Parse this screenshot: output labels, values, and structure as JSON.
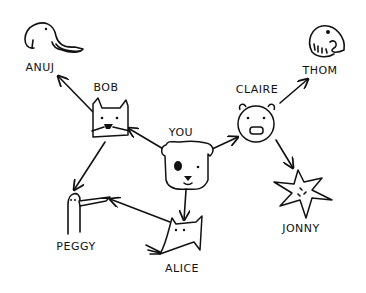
{
  "diagram": {
    "type": "social-network-graph",
    "nodes": [
      {
        "id": "you",
        "label": "YOU",
        "animal": "dog"
      },
      {
        "id": "bob",
        "label": "BOB",
        "animal": "cat"
      },
      {
        "id": "claire",
        "label": "CLAIRE",
        "animal": "pig"
      },
      {
        "id": "alice",
        "label": "ALICE",
        "animal": "rat"
      },
      {
        "id": "anuj",
        "label": "ANUJ",
        "animal": "elephant"
      },
      {
        "id": "peggy",
        "label": "PEGGY",
        "animal": "bird"
      },
      {
        "id": "thom",
        "label": "THOM",
        "animal": "fish"
      },
      {
        "id": "jonny",
        "label": "JONNY",
        "animal": "starfish"
      }
    ],
    "edges": [
      {
        "from": "you",
        "to": "bob"
      },
      {
        "from": "you",
        "to": "claire"
      },
      {
        "from": "you",
        "to": "alice"
      },
      {
        "from": "bob",
        "to": "anuj"
      },
      {
        "from": "bob",
        "to": "peggy"
      },
      {
        "from": "alice",
        "to": "peggy"
      },
      {
        "from": "claire",
        "to": "thom"
      },
      {
        "from": "claire",
        "to": "jonny"
      }
    ],
    "colors": {
      "ink": "#111111",
      "background": "#ffffff"
    }
  }
}
